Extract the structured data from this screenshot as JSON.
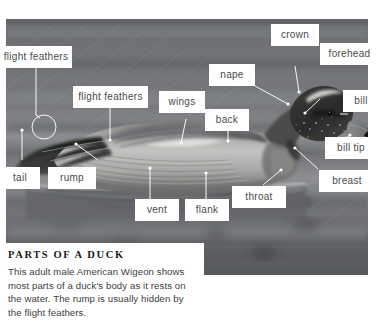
{
  "figure": {
    "photo": {
      "alt": "Black and white photograph of an adult male American Wigeon duck resting on water",
      "palette": {
        "water_dark": "#5f6164",
        "water_mid": "#76787b",
        "water_light": "#9a9c9f",
        "body_light": "#b9bab8",
        "body_mid": "#8e8f8d",
        "body_dark": "#4e4f4d",
        "head_dark": "#2b2b2b",
        "crown_light": "#d8d8d4",
        "bill_gray": "#7d7f80",
        "bill_tip_black": "#161616",
        "leader_line": "#ffffff"
      }
    },
    "labels": [
      {
        "id": "flight-feathers-left",
        "text": "flight feathers"
      },
      {
        "id": "flight-feathers-mid",
        "text": "flight feathers"
      },
      {
        "id": "wings",
        "text": "wings"
      },
      {
        "id": "nape",
        "text": "nape"
      },
      {
        "id": "back",
        "text": "back"
      },
      {
        "id": "crown",
        "text": "crown"
      },
      {
        "id": "forehead",
        "text": "forehead"
      },
      {
        "id": "bill",
        "text": "bill"
      },
      {
        "id": "bill-tip",
        "text": "bill tip"
      },
      {
        "id": "breast",
        "text": "breast"
      },
      {
        "id": "throat",
        "text": "throat"
      },
      {
        "id": "flank",
        "text": "flank"
      },
      {
        "id": "vent",
        "text": "vent"
      },
      {
        "id": "rump",
        "text": "rump"
      },
      {
        "id": "tail",
        "text": "tail"
      }
    ],
    "caption": {
      "title": "PARTS OF A DUCK",
      "body": "This adult male American Wigeon shows most parts of a duck's body as it rests on the water. The rump is usually hidden by the flight feathers."
    }
  }
}
